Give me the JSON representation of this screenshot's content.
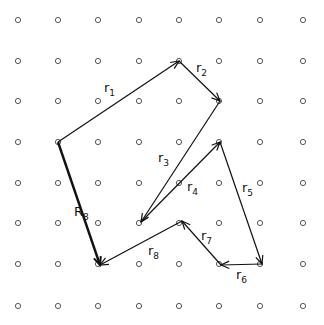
{
  "diagram": {
    "type": "vector-path-on-lattice",
    "lattice": {
      "columns_x": [
        18,
        58,
        98,
        139,
        179,
        219,
        260,
        303
      ],
      "rows_y": [
        20,
        61,
        101,
        142,
        183,
        223,
        264,
        306
      ],
      "dot_radius": 2.6,
      "dot_color": "#555555"
    },
    "line_color": "#111111",
    "vertices": [
      {
        "x": 58,
        "y": 142
      },
      {
        "x": 179,
        "y": 61
      },
      {
        "x": 220,
        "y": 101
      },
      {
        "x": 141,
        "y": 222
      },
      {
        "x": 220,
        "y": 142
      },
      {
        "x": 262,
        "y": 264
      },
      {
        "x": 221,
        "y": 265
      },
      {
        "x": 182,
        "y": 221
      },
      {
        "x": 100,
        "y": 265
      }
    ],
    "vectors": [
      {
        "name": "r",
        "sub": "1",
        "from": 0,
        "to": 1,
        "label_x": 104,
        "label_y": 92,
        "bold": false
      },
      {
        "name": "r",
        "sub": "2",
        "from": 1,
        "to": 2,
        "label_x": 196,
        "label_y": 72,
        "bold": false
      },
      {
        "name": "r",
        "sub": "3",
        "from": 2,
        "to": 3,
        "label_x": 158,
        "label_y": 162,
        "bold": false
      },
      {
        "name": "r",
        "sub": "4",
        "from": 3,
        "to": 4,
        "label_x": 187,
        "label_y": 191,
        "bold": false
      },
      {
        "name": "r",
        "sub": "5",
        "from": 4,
        "to": 5,
        "label_x": 242,
        "label_y": 192,
        "bold": false
      },
      {
        "name": "r",
        "sub": "6",
        "from": 5,
        "to": 6,
        "label_x": 236,
        "label_y": 279,
        "bold": false
      },
      {
        "name": "r",
        "sub": "7",
        "from": 6,
        "to": 7,
        "label_x": 201,
        "label_y": 240,
        "bold": false
      },
      {
        "name": "r",
        "sub": "8",
        "from": 7,
        "to": 8,
        "label_x": 148,
        "label_y": 255,
        "bold": false
      },
      {
        "name": "R",
        "sub": "8",
        "from": 0,
        "to": 8,
        "label_x": 74,
        "label_y": 216,
        "bold": true
      }
    ]
  }
}
